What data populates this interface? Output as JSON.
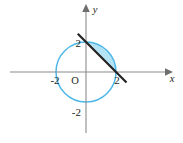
{
  "figure": {
    "colors": {
      "circle_stroke": "#4db8e8",
      "segment_fill": "#b5e3f6",
      "line_stroke": "#231f20",
      "axis_stroke": "#8a8a8a",
      "label_text": "#231f20",
      "background": "#ffffff"
    },
    "axes": {
      "x_label": "x",
      "y_label": "y",
      "origin_label": "O",
      "x_ticks": [
        {
          "value": -2,
          "label": "-2"
        },
        {
          "value": 2,
          "label": "2"
        }
      ],
      "y_ticks": [
        {
          "value": 2,
          "label": "2"
        },
        {
          "value": -2,
          "label": "-2"
        }
      ]
    }
  },
  "chart_data": {
    "type": "line",
    "title": "",
    "subtitle": "",
    "xlabel": "x",
    "ylabel": "y",
    "xlim": [
      -3.0,
      3.2
    ],
    "ylim": [
      -2.4,
      2.4
    ],
    "grid": false,
    "legend": "none",
    "series": [
      {
        "name": "circle",
        "type": "circle",
        "equation": "x^2 + y^2 = 4",
        "center": [
          0,
          0
        ],
        "radius": 2,
        "stroke": "#4db8e8",
        "fill": "none"
      },
      {
        "name": "secant line",
        "type": "line",
        "equation": "x + y = 2",
        "slope": -1,
        "intercept": 2,
        "points": [
          [
            -0.55,
            2.55
          ],
          [
            2.7,
            -0.7
          ]
        ],
        "stroke": "#231f20"
      },
      {
        "name": "circular segment",
        "type": "area",
        "description": "region bounded by chord from (0,2) to (2,0) and the minor arc of the circle",
        "boundary_points": [
          [
            0,
            2
          ],
          [
            2,
            0
          ]
        ],
        "fill": "#b5e3f6"
      }
    ],
    "annotations": [
      {
        "text": "2",
        "x": 0,
        "y": 2,
        "position": "left"
      },
      {
        "text": "2",
        "x": 2,
        "y": 0,
        "position": "below"
      },
      {
        "text": "-2",
        "x": -2,
        "y": 0,
        "position": "below"
      },
      {
        "text": "-2",
        "x": 0,
        "y": -2,
        "position": "left"
      },
      {
        "text": "O",
        "x": 0,
        "y": 0,
        "position": "below-left"
      },
      {
        "text": "x",
        "x": 3.1,
        "y": 0,
        "position": "below-right"
      },
      {
        "text": "y",
        "x": 0,
        "y": 2.35,
        "position": "right"
      }
    ],
    "x_tick_values": [
      -2,
      2
    ],
    "y_tick_values": [
      -2,
      2
    ]
  }
}
